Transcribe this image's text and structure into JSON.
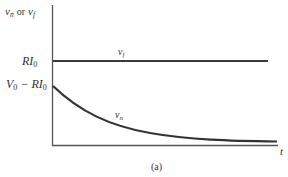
{
  "figure": {
    "caption": "(a)",
    "y_axis_label": {
      "var1": "v",
      "sub1": "n",
      "conj": "or",
      "var2": "v",
      "sub2": "f"
    },
    "x_axis_label": "t",
    "y_ticks": [
      {
        "id": "ri0",
        "main": "RI",
        "sub": "0"
      },
      {
        "id": "v0-ri0",
        "main1": "V",
        "sub1": "0",
        "mid": " − RI",
        "sub2": "0"
      }
    ],
    "curves": [
      {
        "name": "v_f",
        "label_main": "v",
        "label_sub": "f",
        "shape": "constant",
        "level": "RI0"
      },
      {
        "name": "v_n",
        "label_main": "v",
        "label_sub": "n",
        "shape": "exponential decay",
        "start": "V0 - RI0",
        "end": 0
      }
    ],
    "colors": {
      "line": "#3a3a3a",
      "axis": "#555555",
      "text": "#333333"
    }
  }
}
